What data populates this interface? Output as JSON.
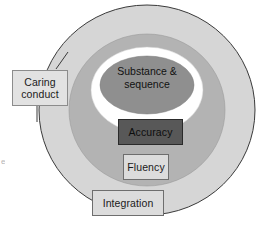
{
  "figure": {
    "type": "concentric-circles"
  },
  "colors": {
    "outer_ring": "#d6d6d6",
    "middle_ring": "#b3b3b3",
    "white_ring": "#ffffff",
    "core_ellipse": "#8f8f8f",
    "ring_stroke": "#3a3a3a",
    "accuracy_box_fill": "#585858",
    "light_box_fill": "#dcdcdc",
    "caring_box_fill": "#e2e2e2",
    "box_border": "#6e6e6e",
    "text": "#1a1a1a"
  },
  "rings": [
    {
      "name": "outer-ring",
      "label": ""
    },
    {
      "name": "middle-ring",
      "label": ""
    },
    {
      "name": "white-ring",
      "label": ""
    }
  ],
  "core": {
    "line1": "Substance &",
    "line2": "sequence"
  },
  "boxes": {
    "caring": {
      "line1": "Caring",
      "line2": "conduct"
    },
    "accuracy": {
      "label": "Accuracy"
    },
    "fluency": {
      "label": "Fluency"
    },
    "integration": {
      "label": "Integration"
    }
  },
  "artifact": {
    "mark": "e"
  }
}
